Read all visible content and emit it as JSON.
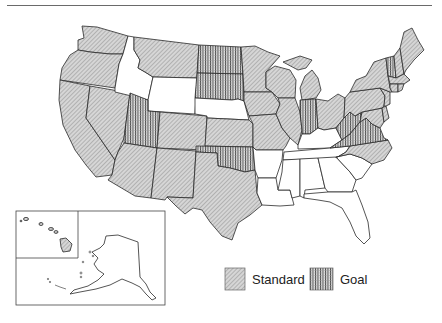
{
  "legend": {
    "items": [
      {
        "key": "standard",
        "label": "Standard",
        "pattern": "diagonal-hatch",
        "color": "#bdbdbd"
      },
      {
        "key": "goal",
        "label": "Goal",
        "pattern": "grid-hatch",
        "color": "#555555"
      }
    ]
  },
  "map": {
    "type": "choropleth",
    "region": "United States",
    "insets": [
      "Alaska",
      "Hawaii"
    ],
    "categories": {
      "standard": [
        "Washington",
        "Oregon",
        "California",
        "Nevada",
        "Montana",
        "Arizona",
        "Colorado",
        "New Mexico",
        "Texas",
        "Kansas",
        "Minnesota",
        "Iowa",
        "Missouri",
        "Wisconsin",
        "Illinois",
        "Michigan",
        "Ohio",
        "Pennsylvania",
        "New York",
        "Maine",
        "New Hampshire",
        "Massachusetts",
        "Connecticut",
        "Rhode Island",
        "New Jersey",
        "Delaware",
        "Maryland",
        "North Carolina",
        "Hawaii"
      ],
      "goal": [
        "Utah",
        "North Dakota",
        "South Dakota",
        "Oklahoma",
        "Indiana",
        "West Virginia",
        "Virginia",
        "Vermont"
      ],
      "none": [
        "Idaho",
        "Wyoming",
        "Nebraska",
        "Arkansas",
        "Louisiana",
        "Kentucky",
        "Tennessee",
        "Mississippi",
        "Alabama",
        "Georgia",
        "South Carolina",
        "Florida",
        "Alaska"
      ]
    }
  }
}
